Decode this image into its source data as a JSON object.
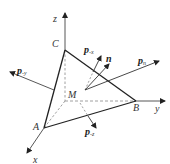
{
  "diagram": {
    "title": "",
    "colors": {
      "edge": "#222222",
      "axis": "#444444",
      "dashed": "#888888",
      "vector": "#333333"
    },
    "axes": {
      "x": {
        "label": "x"
      },
      "y": {
        "label": "y"
      },
      "z": {
        "label": "z"
      }
    },
    "points": {
      "A": {
        "label": "A"
      },
      "B": {
        "label": "B"
      },
      "C": {
        "label": "C"
      },
      "M": {
        "label": "M"
      }
    },
    "vectors": {
      "p_neg_y": {
        "base": "p",
        "sub": "-y"
      },
      "p_neg_x": {
        "base": "p",
        "sub": "-x"
      },
      "p_neg_z": {
        "base": "p",
        "sub": "-z"
      },
      "n": {
        "base": "n",
        "sub": ""
      },
      "p_n": {
        "base": "p",
        "sub": "n"
      }
    }
  }
}
